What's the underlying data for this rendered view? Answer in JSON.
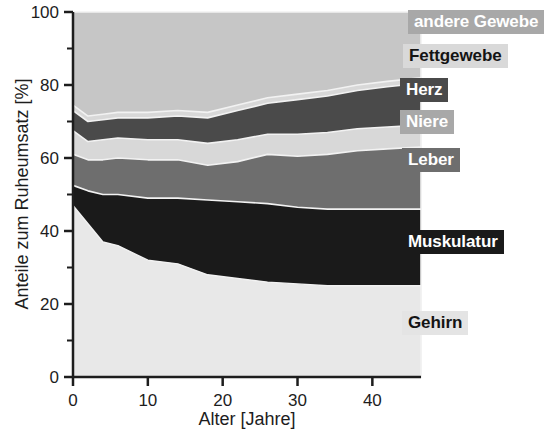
{
  "figure": {
    "background": "#ffffff",
    "plot_background": "#e8e8e8"
  },
  "axes": {
    "y_title": "Anteile zum Ruheumsatz [%]",
    "x_title": "Alter [Jahre]",
    "y_ticks": [
      "0",
      "20",
      "40",
      "60",
      "80",
      "100"
    ],
    "x_ticks": [
      "0",
      "10",
      "20",
      "30",
      "40"
    ]
  },
  "legend": {
    "items": [
      {
        "label": "andere Gewebe",
        "bg": "#a8a8a8",
        "fg": "#ffffff"
      },
      {
        "label": "Fettgewebe",
        "bg": "#d9d9d9",
        "fg": "#141414"
      },
      {
        "label": "Herz",
        "bg": "#4a4a4a",
        "fg": "#ffffff"
      },
      {
        "label": "Niere",
        "bg": "#a8a8a8",
        "fg": "#ffffff"
      },
      {
        "label": "Leber",
        "bg": "#6e6e6e",
        "fg": "#ffffff"
      },
      {
        "label": "Muskulatur",
        "bg": "#1a1a1a",
        "fg": "#ffffff"
      },
      {
        "label": "Gehirn",
        "bg": "#e4e4e4",
        "fg": "#141414"
      }
    ]
  },
  "chart_data": {
    "type": "area",
    "title": "",
    "xlabel": "Alter [Jahre]",
    "ylabel": "Anteile zum Ruheumsatz [%]",
    "xlim": [
      0,
      46.5
    ],
    "ylim": [
      0,
      100
    ],
    "xticks": [
      0,
      10,
      20,
      30,
      40
    ],
    "yticks": [
      0,
      20,
      40,
      60,
      80,
      100
    ],
    "yminorticks": [
      10,
      30,
      50,
      70,
      90
    ],
    "grid": false,
    "stacked": true,
    "stack_order": "bottom-to-top",
    "legend_position": "right-inside",
    "x": [
      0,
      2,
      4,
      6,
      10,
      14,
      18,
      22,
      26,
      30,
      34,
      38,
      42,
      46.5
    ],
    "series": [
      {
        "name": "Gehirn",
        "color": "#e8e8e8",
        "values": [
          47,
          42,
          37,
          36,
          32,
          31,
          28,
          27,
          26,
          25.5,
          25,
          25,
          25,
          25
        ],
        "cumulative_top": [
          47,
          42,
          37,
          36,
          32,
          31,
          28,
          27,
          26,
          25.5,
          25,
          25,
          25,
          25
        ]
      },
      {
        "name": "Muskulatur",
        "color": "#1a1a1a",
        "values": [
          5.5,
          9,
          13,
          14,
          17,
          18,
          20.5,
          21,
          21.5,
          21,
          21,
          21,
          21,
          21
        ],
        "cumulative_top": [
          52.5,
          51,
          50,
          50,
          49,
          49,
          48.5,
          48,
          47.5,
          46.5,
          46,
          46,
          46,
          46
        ]
      },
      {
        "name": "Leber",
        "color": "#6e6e6e",
        "values": [
          8.5,
          8.5,
          9.5,
          10,
          10.5,
          10.5,
          9.5,
          11,
          13.5,
          14,
          15,
          16,
          16.5,
          17
        ],
        "cumulative_top": [
          61,
          59.5,
          59.5,
          60,
          59.5,
          59.5,
          58,
          59,
          61,
          60.5,
          61,
          62,
          62.5,
          63
        ]
      },
      {
        "name": "Niere",
        "color": "#d8d8d8",
        "values": [
          6.5,
          5,
          5.5,
          5.5,
          5.5,
          5.5,
          6,
          6,
          5.5,
          6,
          6,
          6,
          6,
          6
        ]
      },
      {
        "name": "Herz",
        "color": "#4a4a4a",
        "values": [
          5.5,
          5.5,
          5.5,
          5.5,
          6,
          6.5,
          7,
          8,
          8.5,
          9.5,
          10,
          10.5,
          11,
          11.5
        ],
        "cumulative_top": [
          73,
          70,
          70.5,
          71,
          71,
          71.5,
          71,
          73,
          75,
          76,
          77,
          78.5,
          79.5,
          80.5
        ]
      },
      {
        "name": "Fettgewebe",
        "color": "#d8d8d8",
        "values": [
          1.5,
          1.5,
          1.5,
          1.5,
          1.5,
          1.5,
          1.5,
          1.5,
          1.5,
          1.5,
          1.5,
          1.5,
          1.5,
          1.5
        ],
        "cumulative_top": [
          74.5,
          71.5,
          72,
          72.5,
          72.5,
          73,
          72.5,
          74.5,
          76.5,
          77.5,
          78.5,
          80,
          81,
          82
        ]
      },
      {
        "name": "andere Gewebe",
        "color": "#c6c6c6",
        "values": [
          25.5,
          28.5,
          28,
          27.5,
          27.5,
          27,
          27.5,
          25.5,
          23.5,
          22.5,
          21.5,
          20,
          19,
          18
        ],
        "cumulative_top": [
          100,
          100,
          100,
          100,
          100,
          100,
          100,
          100,
          100,
          100,
          100,
          100,
          100,
          100
        ]
      }
    ]
  }
}
